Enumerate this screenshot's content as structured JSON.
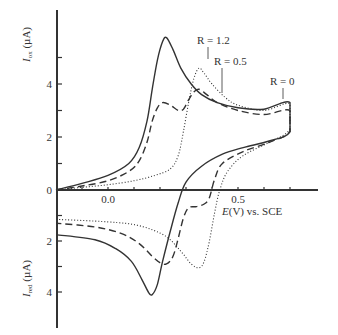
{
  "chart_data": {
    "type": "line",
    "title": "",
    "xlabel": "E (V) vs. SCE",
    "ylabel_top": "I_ox (µA)",
    "ylabel_bottom": "I_red (µA)",
    "xlim": [
      -0.2,
      0.8
    ],
    "ylim": [
      -5.5,
      6.8
    ],
    "x_ticks": [
      -0.2,
      -0.1,
      0.0,
      0.1,
      0.2,
      0.3,
      0.4,
      0.5,
      0.6,
      0.7
    ],
    "x_tick_labels": [
      {
        "value": 0.0,
        "label": "0.0"
      },
      {
        "value": 0.5,
        "label": "0.5"
      }
    ],
    "y_ox_ticks": [
      {
        "value": 0,
        "label": "0"
      },
      {
        "value": 1,
        "label": ""
      },
      {
        "value": 2,
        "label": "2"
      },
      {
        "value": 3,
        "label": ""
      },
      {
        "value": 4,
        "label": "4"
      },
      {
        "value": 5,
        "label": ""
      }
    ],
    "y_red_ticks": [
      {
        "value": 1,
        "label": ""
      },
      {
        "value": 2,
        "label": "2"
      },
      {
        "value": 3,
        "label": ""
      },
      {
        "value": 4,
        "label": "4"
      }
    ],
    "grid": false,
    "legend": "inline annotations",
    "annotations": [
      {
        "text": "R = 1.2",
        "series": "R = 1.2"
      },
      {
        "text": "R = 0.5",
        "series": "R = 0.5"
      },
      {
        "text": "R = 0",
        "series": "R = 0"
      }
    ],
    "series": [
      {
        "name": "R = 0",
        "style": "solid",
        "points": [
          [
            -0.2,
            0.0
          ],
          [
            -0.1,
            0.25
          ],
          [
            0.0,
            0.55
          ],
          [
            0.08,
            1.0
          ],
          [
            0.12,
            1.6
          ],
          [
            0.15,
            2.6
          ],
          [
            0.17,
            3.8
          ],
          [
            0.19,
            4.9
          ],
          [
            0.21,
            5.6
          ],
          [
            0.225,
            5.75
          ],
          [
            0.25,
            5.3
          ],
          [
            0.28,
            4.6
          ],
          [
            0.32,
            4.0
          ],
          [
            0.36,
            3.6
          ],
          [
            0.42,
            3.3
          ],
          [
            0.5,
            3.1
          ],
          [
            0.6,
            3.05
          ],
          [
            0.7,
            3.3
          ],
          [
            0.7,
            2.2
          ],
          [
            0.62,
            1.85
          ],
          [
            0.52,
            1.6
          ],
          [
            0.44,
            1.35
          ],
          [
            0.36,
            0.9
          ],
          [
            0.3,
            0.3
          ],
          [
            0.27,
            -0.5
          ],
          [
            0.24,
            -1.6
          ],
          [
            0.21,
            -2.8
          ],
          [
            0.19,
            -3.7
          ],
          [
            0.17,
            -4.1
          ],
          [
            0.155,
            -4.0
          ],
          [
            0.13,
            -3.5
          ],
          [
            0.09,
            -2.8
          ],
          [
            0.03,
            -2.3
          ],
          [
            -0.05,
            -1.95
          ],
          [
            -0.2,
            -1.75
          ]
        ]
      },
      {
        "name": "R = 0.5",
        "style": "dashed",
        "points": [
          [
            -0.2,
            0.0
          ],
          [
            -0.1,
            0.15
          ],
          [
            0.0,
            0.35
          ],
          [
            0.08,
            0.7
          ],
          [
            0.12,
            1.1
          ],
          [
            0.15,
            1.8
          ],
          [
            0.17,
            2.6
          ],
          [
            0.19,
            3.1
          ],
          [
            0.21,
            3.3
          ],
          [
            0.24,
            3.2
          ],
          [
            0.27,
            3.0
          ],
          [
            0.29,
            3.05
          ],
          [
            0.31,
            3.4
          ],
          [
            0.33,
            3.7
          ],
          [
            0.35,
            3.8
          ],
          [
            0.38,
            3.6
          ],
          [
            0.42,
            3.3
          ],
          [
            0.5,
            3.0
          ],
          [
            0.6,
            2.85
          ],
          [
            0.7,
            3.0
          ],
          [
            0.7,
            2.2
          ],
          [
            0.62,
            1.8
          ],
          [
            0.52,
            1.45
          ],
          [
            0.44,
            1.0
          ],
          [
            0.41,
            0.4
          ],
          [
            0.39,
            -0.3
          ],
          [
            0.37,
            -0.55
          ],
          [
            0.34,
            -0.65
          ],
          [
            0.31,
            -0.7
          ],
          [
            0.29,
            -1.1
          ],
          [
            0.27,
            -1.9
          ],
          [
            0.25,
            -2.6
          ],
          [
            0.225,
            -2.9
          ],
          [
            0.2,
            -2.85
          ],
          [
            0.17,
            -2.6
          ],
          [
            0.12,
            -2.1
          ],
          [
            0.05,
            -1.7
          ],
          [
            -0.05,
            -1.45
          ],
          [
            -0.2,
            -1.3
          ]
        ]
      },
      {
        "name": "R = 1.2",
        "style": "dotted",
        "points": [
          [
            -0.2,
            0.0
          ],
          [
            -0.1,
            0.1
          ],
          [
            0.0,
            0.2
          ],
          [
            0.1,
            0.35
          ],
          [
            0.18,
            0.55
          ],
          [
            0.24,
            0.8
          ],
          [
            0.27,
            1.3
          ],
          [
            0.29,
            2.2
          ],
          [
            0.31,
            3.3
          ],
          [
            0.33,
            4.2
          ],
          [
            0.35,
            4.6
          ],
          [
            0.37,
            4.4
          ],
          [
            0.4,
            4.0
          ],
          [
            0.45,
            3.5
          ],
          [
            0.5,
            3.2
          ],
          [
            0.6,
            3.0
          ],
          [
            0.7,
            3.25
          ],
          [
            0.7,
            2.3
          ],
          [
            0.62,
            1.8
          ],
          [
            0.52,
            1.3
          ],
          [
            0.46,
            0.7
          ],
          [
            0.43,
            0.0
          ],
          [
            0.41,
            -0.9
          ],
          [
            0.39,
            -2.0
          ],
          [
            0.37,
            -2.8
          ],
          [
            0.35,
            -3.05
          ],
          [
            0.32,
            -2.9
          ],
          [
            0.28,
            -2.4
          ],
          [
            0.22,
            -1.8
          ],
          [
            0.12,
            -1.4
          ],
          [
            0.0,
            -1.25
          ],
          [
            -0.2,
            -1.15
          ]
        ]
      }
    ]
  },
  "labels": {
    "x_axis": "E(V) vs. SCE",
    "y_ox_main": "I",
    "y_ox_sub": "ox",
    "y_ox_unit": " (µA)",
    "y_red_main": "I",
    "y_red_sub": "red",
    "y_red_unit": " (µA)",
    "annot_r12": "R = 1.2",
    "annot_r05": "R = 0.5",
    "annot_r0": "R = 0"
  },
  "colors": {
    "line": "#333333",
    "axis": "#333333"
  }
}
